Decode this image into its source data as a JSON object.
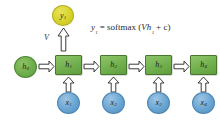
{
  "diagram": {
    "formula": {
      "text": "y₁ = softmax (Vh₁ + c)",
      "lhs": "y",
      "lhs_sub": "1",
      "eq": " = softmax (",
      "weight": "V",
      "hidden": "h",
      "hidden_sub": "1",
      "bias": " + c)"
    },
    "weight_label": "V",
    "output_node": {
      "symbol": "y",
      "subscript": "1",
      "color": "#d6d32c",
      "shape": "circle"
    },
    "initial_state": {
      "symbol": "h",
      "subscript": "0",
      "color": "#6fae4c",
      "shape": "circle"
    },
    "hidden_states": [
      {
        "symbol": "h",
        "subscript": "1",
        "color": "#6fae4c",
        "shape": "rectangle"
      },
      {
        "symbol": "h",
        "subscript": "2",
        "color": "#6fae4c",
        "shape": "rectangle"
      },
      {
        "symbol": "h",
        "subscript": "3",
        "color": "#6fae4c",
        "shape": "rectangle"
      },
      {
        "symbol": "h",
        "subscript": "4",
        "color": "#6fae4c",
        "shape": "rectangle"
      }
    ],
    "inputs": [
      {
        "symbol": "x",
        "subscript": "1",
        "color": "#6aa5d2",
        "shape": "circle"
      },
      {
        "symbol": "x",
        "subscript": "2",
        "color": "#6aa5d2",
        "shape": "circle"
      },
      {
        "symbol": "x",
        "subscript": "3",
        "color": "#6aa5d2",
        "shape": "circle"
      },
      {
        "symbol": "x",
        "subscript": "4",
        "color": "#6aa5d2",
        "shape": "circle"
      }
    ],
    "background": "#ffffff"
  }
}
